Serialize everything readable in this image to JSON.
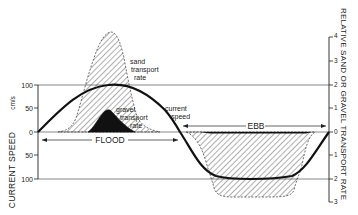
{
  "diagram": {
    "type": "tidal current speed vs sediment transport rate",
    "left_axis": {
      "title": "CURRENT SPEED",
      "units": "cm/s",
      "ticks": [
        "100",
        "50",
        "0",
        "50",
        "100"
      ]
    },
    "right_axis": {
      "title": "RELATIVE SAND OR GRAVEL TRANSPORT RATE",
      "ticks": [
        "4",
        "3",
        "2",
        "1",
        "0",
        "1",
        "2",
        "3"
      ]
    },
    "labels": {
      "sand": [
        "sand",
        "transport",
        "rate"
      ],
      "gravel": [
        "gravel",
        "transport",
        "rate"
      ],
      "current": [
        "current",
        "speed"
      ]
    },
    "phases": {
      "flood": "FLOOD",
      "ebb": "EBB"
    },
    "colors": {
      "ink": "#1a1a1a",
      "background": "#ffffff",
      "gridline": "#555555"
    }
  }
}
